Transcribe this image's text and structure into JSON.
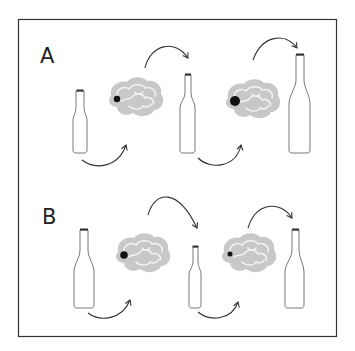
{
  "figure": {
    "panels": [
      {
        "label": "A",
        "description": "Bottle size increases across sequence; brain dot grows",
        "sequence": [
          "small-bottle",
          "brain-small-dot",
          "medium-bottle",
          "brain-large-dot",
          "large-bottle"
        ]
      },
      {
        "label": "B",
        "description": "Bottle size decreases then increases; brain dot shrinks",
        "sequence": [
          "large-bottle",
          "brain-medium-dot",
          "small-bottle",
          "brain-small-dot",
          "large-bottle"
        ]
      }
    ],
    "colors": {
      "border": "#333333",
      "brain_fill": "#c8c8c8",
      "brain_gyri": "#f2f2f2",
      "dot": "#111111",
      "arrow": "#333333",
      "bottle_stroke": "#555555",
      "bottle_cap": "#333333"
    }
  }
}
